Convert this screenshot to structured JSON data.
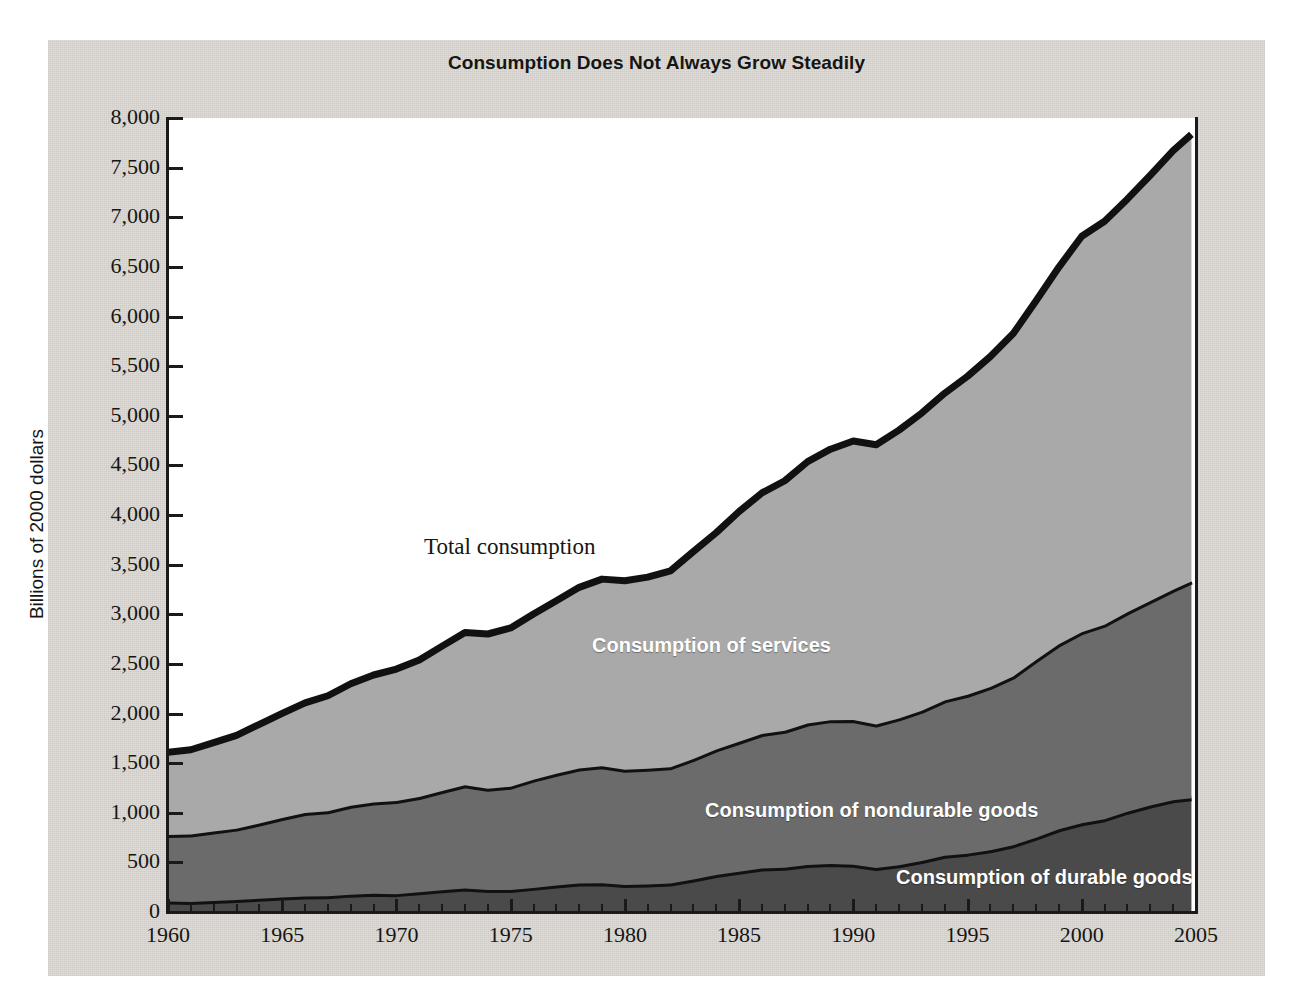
{
  "chart_title": "Consumption Does Not Always Grow Steadily",
  "axes": {
    "y_title": "Billions of 2000 dollars",
    "y_ticks": [
      "8,000",
      "7,500",
      "7,000",
      "6,500",
      "6,000",
      "5,500",
      "5,000",
      "4,500",
      "4,000",
      "3,500",
      "3,000",
      "2,500",
      "2,000",
      "1,500",
      "1,000",
      "500",
      "0"
    ],
    "x_ticks": [
      "1960",
      "1965",
      "1970",
      "1975",
      "1980",
      "1985",
      "1990",
      "1995",
      "2000",
      "2005"
    ]
  },
  "annotations": {
    "total": "Total consumption",
    "services": "Consumption of services",
    "nondurable": "Consumption of nondurable goods",
    "durable": "Consumption of durable goods"
  },
  "colors": {
    "panel": "#dedbd6",
    "plot_background": "#ffffff",
    "services_fill": "#a9a9a9",
    "nondurable_fill": "#6b6b6b",
    "durable_fill": "#4a4a4a",
    "outline": "#111111",
    "text": "#151515"
  },
  "chart_data": {
    "type": "area",
    "stacked": true,
    "title": "Consumption Does Not Always Grow Steadily",
    "xlabel": "",
    "ylabel": "Billions of 2000 dollars",
    "xlim": [
      1960,
      2005
    ],
    "ylim": [
      0,
      8000
    ],
    "grid": false,
    "legend": "inline-band-labels",
    "x": [
      1960,
      1961,
      1962,
      1963,
      1964,
      1965,
      1966,
      1967,
      1968,
      1969,
      1970,
      1971,
      1972,
      1973,
      1974,
      1975,
      1976,
      1977,
      1978,
      1979,
      1980,
      1981,
      1982,
      1983,
      1984,
      1985,
      1986,
      1987,
      1988,
      1989,
      1990,
      1991,
      1992,
      1993,
      1994,
      1995,
      1996,
      1997,
      1998,
      1999,
      2000,
      2001,
      2002,
      2003,
      2004,
      2004.8
    ],
    "series": [
      {
        "name": "Consumption of durable goods",
        "values": [
          105,
          102,
          112,
          122,
          133,
          147,
          157,
          159,
          175,
          183,
          180,
          198,
          219,
          236,
          221,
          222,
          243,
          267,
          286,
          289,
          272,
          276,
          288,
          327,
          372,
          405,
          438,
          445,
          473,
          483,
          475,
          443,
          470,
          513,
          567,
          588,
          622,
          673,
          748,
          833,
          894,
          935,
          1010,
          1073,
          1126,
          1145
        ]
      },
      {
        "name": "Consumption of nondurable goods",
        "values": [
          670,
          678,
          700,
          718,
          758,
          800,
          840,
          855,
          895,
          920,
          938,
          960,
          1000,
          1040,
          1020,
          1040,
          1090,
          1125,
          1160,
          1180,
          1160,
          1168,
          1170,
          1215,
          1265,
          1310,
          1355,
          1380,
          1425,
          1450,
          1460,
          1445,
          1480,
          1515,
          1565,
          1600,
          1645,
          1700,
          1790,
          1865,
          1925,
          1960,
          2010,
          2060,
          2120,
          2185
        ]
      },
      {
        "name": "Consumption of services",
        "values": [
          835,
          855,
          895,
          940,
          1000,
          1055,
          1110,
          1165,
          1230,
          1285,
          1330,
          1380,
          1460,
          1540,
          1560,
          1600,
          1670,
          1745,
          1825,
          1885,
          1905,
          1930,
          1980,
          2090,
          2185,
          2320,
          2430,
          2520,
          2640,
          2730,
          2810,
          2820,
          2905,
          3000,
          3095,
          3210,
          3330,
          3455,
          3620,
          3800,
          3990,
          4065,
          4165,
          4290,
          4425,
          4505
        ]
      }
    ],
    "totals": [
      1610,
      1635,
      1707,
      1780,
      1891,
      2002,
      2107,
      2179,
      2300,
      2388,
      2448,
      2538,
      2679,
      2816,
      2801,
      2862,
      3003,
      3137,
      3271,
      3354,
      3337,
      3374,
      3438,
      3632,
      3822,
      4035,
      4223,
      4345,
      4538,
      4663,
      4745,
      4708,
      4855,
      5028,
      5227,
      5398,
      5597,
      5828,
      6158,
      6498,
      6809,
      6960,
      7185,
      7423,
      7671,
      7835
    ]
  }
}
